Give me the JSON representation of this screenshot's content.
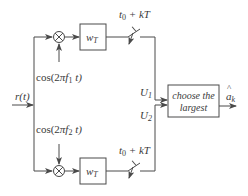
{
  "diagram": {
    "input": {
      "label": "r(t)"
    },
    "branches": [
      {
        "carrier_label": "cos(2πf₁ t)",
        "carrier_prefix": "cos(2",
        "carrier_pi": "π",
        "carrier_f": "f",
        "carrier_sub": "1",
        "carrier_suffix": " t)",
        "multiplier_icon": "multiplier-circle-x",
        "filter_label": "w",
        "filter_sub": "T",
        "sampler_label": "t₀ + kT",
        "sampler_t": "t",
        "sampler_sub": "0",
        "sampler_rest": " + kT",
        "output_label": "U",
        "output_sub": "1"
      },
      {
        "carrier_label": "cos(2πf₂ t)",
        "carrier_prefix": "cos(2",
        "carrier_pi": "π",
        "carrier_f": "f",
        "carrier_sub": "2",
        "carrier_suffix": " t)",
        "multiplier_icon": "multiplier-circle-x",
        "filter_label": "w",
        "filter_sub": "T",
        "sampler_label": "t₀ + kT",
        "sampler_t": "t",
        "sampler_sub": "0",
        "sampler_rest": " + kT",
        "output_label": "U",
        "output_sub": "2"
      }
    ],
    "decision": {
      "line1": "choose the",
      "line2": "largest"
    },
    "output": {
      "label": "âₖ",
      "base": "a",
      "hat": "^",
      "sub": "k"
    },
    "colors": {
      "stroke": "#4a4a4a",
      "text": "#3a3a3a",
      "background": "#ffffff"
    }
  }
}
